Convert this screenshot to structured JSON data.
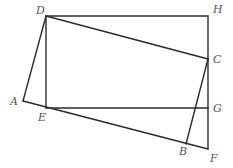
{
  "diagram": {
    "type": "geometry",
    "points": {
      "D": {
        "x": 46,
        "y": 16,
        "label": "D",
        "lx": 36,
        "ly": 14
      },
      "H": {
        "x": 208,
        "y": 16,
        "label": "H",
        "lx": 213,
        "ly": 13
      },
      "C": {
        "x": 208,
        "y": 59,
        "label": "C",
        "lx": 213,
        "ly": 63
      },
      "A": {
        "x": 23,
        "y": 101,
        "label": "A",
        "lx": 10,
        "ly": 105
      },
      "E": {
        "x": 46,
        "y": 108,
        "label": "E",
        "lx": 38,
        "ly": 121
      },
      "G": {
        "x": 208,
        "y": 108,
        "label": "G",
        "lx": 213,
        "ly": 112
      },
      "B": {
        "x": 186,
        "y": 144,
        "label": "B",
        "lx": 179,
        "ly": 155
      },
      "F": {
        "x": 208,
        "y": 149,
        "label": "F",
        "lx": 210,
        "ly": 162
      }
    },
    "segments": [
      [
        "D",
        "H"
      ],
      [
        "H",
        "F"
      ],
      [
        "D",
        "E"
      ],
      [
        "E",
        "G"
      ],
      [
        "D",
        "C"
      ],
      [
        "C",
        "B"
      ],
      [
        "A",
        "D"
      ],
      [
        "A",
        "F"
      ]
    ]
  }
}
